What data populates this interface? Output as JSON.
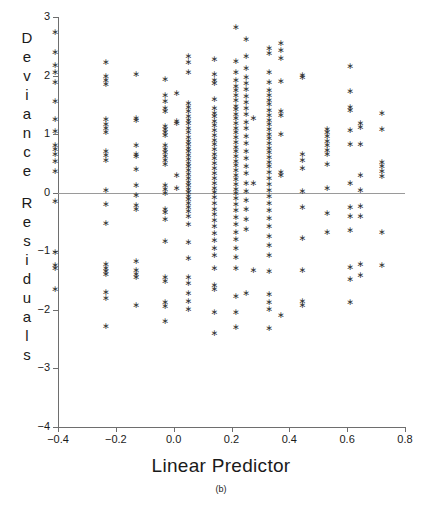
{
  "chart_data": {
    "type": "scatter",
    "title": "",
    "xlabel": "Linear Predictor",
    "ylabel": "Deviance Residuals",
    "caption": "(b)",
    "xlim": [
      -0.4,
      0.8
    ],
    "ylim": [
      -4,
      3
    ],
    "grid": false,
    "legend": null,
    "marker": "asterisk",
    "reference_line_y": 0,
    "xticks": [
      -0.4,
      -0.2,
      0.0,
      0.2,
      0.4,
      0.6,
      0.8
    ],
    "xticklabels": [
      "-0.4",
      "-0.2",
      "0.0",
      "0.2",
      "0.4",
      "0.6",
      "0.8"
    ],
    "yticks": [
      -4,
      -3,
      -2,
      -1,
      0,
      1,
      2,
      3
    ],
    "yticklabels": [
      "-4",
      "-3",
      "-2",
      "-1",
      "0",
      "1",
      "2",
      "3"
    ],
    "columns": [
      {
        "x": -0.41,
        "y": [
          2.73,
          2.4,
          2.18,
          2.05,
          1.88,
          1.56,
          1.25,
          1.05,
          0.8,
          0.73,
          0.66,
          0.53,
          0.37,
          -0.15,
          -1.02,
          -1.25,
          -1.3,
          -1.65
        ]
      },
      {
        "x": -0.235,
        "y": [
          2.22,
          1.98,
          1.92,
          1.84,
          1.25,
          1.17,
          1.1,
          1.02,
          0.7,
          0.64,
          0.55,
          0.03,
          -0.2,
          -0.52,
          -1.22,
          -1.3,
          -1.35,
          -1.4,
          -1.7,
          -1.8,
          -2.28
        ]
      },
      {
        "x": -0.13,
        "y": [
          2.02,
          1.27,
          1.24,
          0.8,
          0.66,
          0.62,
          0.4,
          0.13,
          -0.05,
          -0.22,
          -0.28,
          -1.18,
          -1.33,
          -1.4,
          -1.45,
          -1.92
        ]
      },
      {
        "x": -0.03,
        "y": [
          1.94,
          1.66,
          1.55,
          1.44,
          1.38,
          1.13,
          1.08,
          1.02,
          0.97,
          0.8,
          0.74,
          0.68,
          0.62,
          0.55,
          0.48,
          0.12,
          0.05,
          -0.02,
          -0.28,
          -0.34,
          -0.45,
          -0.84,
          -1.45,
          -1.52,
          -1.88,
          -1.95,
          -2.2
        ]
      },
      {
        "x": 0.01,
        "y": [
          1.7,
          1.22,
          1.18,
          0.3,
          0.08
        ]
      },
      {
        "x": 0.05,
        "y": [
          2.32,
          2.22,
          2.05,
          1.52,
          1.45,
          1.38,
          1.3,
          1.24,
          1.18,
          1.1,
          1.02,
          0.95,
          0.88,
          0.82,
          0.76,
          0.7,
          0.63,
          0.57,
          0.5,
          0.44,
          0.38,
          0.31,
          0.25,
          0.18,
          0.12,
          0.06,
          0.0,
          -0.06,
          -0.12,
          -0.18,
          -0.25,
          -0.32,
          -0.4,
          -0.55,
          -0.85,
          -1.12,
          -1.45,
          -1.55,
          -1.72,
          -1.86,
          -2.0
        ]
      },
      {
        "x": 0.14,
        "y": [
          2.28,
          2.02,
          1.92,
          1.86,
          1.6,
          1.44,
          1.36,
          1.3,
          1.22,
          1.14,
          1.06,
          0.98,
          0.9,
          0.82,
          0.74,
          0.66,
          0.58,
          0.5,
          0.42,
          0.33,
          0.25,
          0.16,
          0.08,
          0.0,
          -0.08,
          -0.18,
          -0.28,
          -0.38,
          -0.48,
          -0.58,
          -0.7,
          -0.82,
          -0.95,
          -1.08,
          -1.3,
          -1.58,
          -1.65,
          -2.05,
          -2.4
        ]
      },
      {
        "x": 0.215,
        "y": [
          2.82,
          2.24,
          2.06,
          1.92,
          1.82,
          1.74,
          1.66,
          1.58,
          1.48,
          1.42,
          1.34,
          1.26,
          1.18,
          1.1,
          1.02,
          0.94,
          0.86,
          0.78,
          0.7,
          0.62,
          0.54,
          0.46,
          0.38,
          0.3,
          0.22,
          0.14,
          0.06,
          -0.02,
          -0.1,
          -0.2,
          -0.3,
          -0.42,
          -0.55,
          -0.68,
          -0.8,
          -0.95,
          -1.1,
          -1.3,
          -1.78,
          -2.05,
          -2.3
        ]
      },
      {
        "x": 0.25,
        "y": [
          2.62,
          2.32,
          2.12,
          1.96,
          1.86,
          1.76,
          1.64,
          1.54,
          1.44,
          1.34,
          1.2,
          1.1,
          0.96,
          0.84,
          0.7,
          0.58,
          0.44,
          0.32,
          0.16,
          0.02,
          -0.14,
          -0.28,
          -0.46,
          -0.62,
          -1.72
        ]
      },
      {
        "x": 0.275,
        "y": [
          1.27,
          0.15,
          -1.32
        ]
      },
      {
        "x": 0.33,
        "y": [
          2.46,
          2.38,
          2.06,
          1.88,
          1.74,
          1.66,
          1.58,
          1.5,
          1.4,
          1.32,
          1.24,
          1.16,
          1.08,
          1.0,
          0.92,
          0.84,
          0.76,
          0.68,
          0.6,
          0.52,
          0.44,
          0.34,
          0.24,
          0.14,
          0.04,
          -0.06,
          -0.18,
          -0.3,
          -0.44,
          -0.58,
          -0.74,
          -0.9,
          -1.08,
          -1.34,
          -1.74,
          -1.88,
          -2.0,
          -2.32
        ]
      },
      {
        "x": 0.37,
        "y": [
          2.55,
          2.42,
          2.3,
          1.9,
          1.38,
          1.32,
          1.0,
          0.34,
          0.3,
          -2.1
        ]
      },
      {
        "x": 0.445,
        "y": [
          2.0,
          1.96,
          0.66,
          0.55,
          0.42,
          0.02,
          -0.26,
          -0.78,
          -1.32,
          -1.85,
          -1.92
        ]
      },
      {
        "x": 0.53,
        "y": [
          1.08,
          1.02,
          0.96,
          0.88,
          0.8,
          0.72,
          0.66,
          0.48,
          0.08,
          -0.36,
          -0.68
        ]
      },
      {
        "x": 0.61,
        "y": [
          2.16,
          1.72,
          1.46,
          1.4,
          1.06,
          0.82,
          0.16,
          -0.26,
          -0.4,
          -0.64,
          -1.28,
          -1.48,
          -1.88
        ]
      },
      {
        "x": 0.645,
        "y": [
          1.18,
          1.12,
          0.82,
          0.3,
          0.04,
          -0.24,
          -0.4,
          -1.22,
          -1.42
        ]
      },
      {
        "x": 0.72,
        "y": [
          1.36,
          1.08,
          0.52,
          0.44,
          0.36,
          0.28,
          -0.68,
          -1.24
        ]
      }
    ]
  },
  "axis": {
    "x_title": "Linear Predictor",
    "y_title": "Deviance Residuals",
    "y_title_words": [
      "Deviance",
      "Residuals"
    ],
    "panel_label": "(b)"
  },
  "colors": {
    "marker": "#333333",
    "axis": "#6e6e6e",
    "reference_line": "#9a9a9a",
    "background": "#ffffff",
    "text": "#1a1a1a"
  }
}
